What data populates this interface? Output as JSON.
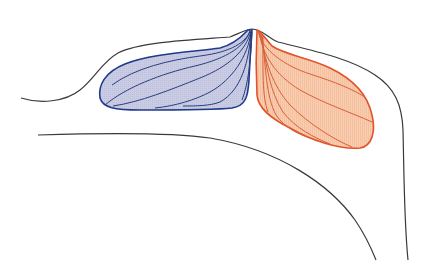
{
  "diagram": {
    "kind": "anatomical-illustration",
    "labels": [],
    "colors": {
      "background": "#ffffff",
      "outline": "#3a3a3a",
      "left_lobe_stroke": "#1f3a8a",
      "left_lobe_fill": "#c9cce3",
      "left_lobe_fibers": "#2a3f7e",
      "right_lobe_stroke": "#e3532a",
      "right_lobe_fill": "#f8cdb0",
      "right_lobe_fibers": "#d9603a"
    },
    "elements": [
      {
        "name": "outer-contour",
        "description": "Black outer contour line"
      },
      {
        "name": "inner-contour",
        "description": "Black inner curved line"
      },
      {
        "name": "left-lobe",
        "description": "Blue shaded lobe with fanning fibers"
      },
      {
        "name": "right-lobe",
        "description": "Orange shaded lobe with fanning fibers"
      }
    ]
  }
}
